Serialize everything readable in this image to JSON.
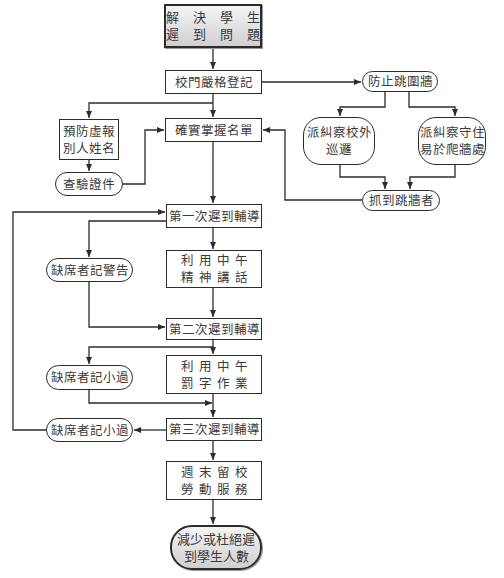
{
  "diagram": {
    "type": "flowchart",
    "nodes": {
      "start": {
        "lines": [
          "解 決 學 生",
          "遲 到 問 題"
        ],
        "shape": "terminal-rect"
      },
      "gate_register": {
        "lines": [
          "校門嚴格登記"
        ],
        "shape": "rect"
      },
      "prevent_fake_name": {
        "lines": [
          "預防虛報",
          "別人姓名"
        ],
        "shape": "rect"
      },
      "check_id": {
        "lines": [
          "查驗證件"
        ],
        "shape": "pill"
      },
      "confirm_list": {
        "lines": [
          "確實掌握名單"
        ],
        "shape": "rect"
      },
      "prevent_wall_jump": {
        "lines": [
          "防止跳圍牆"
        ],
        "shape": "pill"
      },
      "patrol_outside": {
        "lines": [
          "派糾察校外",
          "巡邏"
        ],
        "shape": "rounded"
      },
      "guard_wall": {
        "lines": [
          "派糾察守住",
          "易於爬牆處"
        ],
        "shape": "rounded"
      },
      "catch_jumpers": {
        "lines": [
          "抓到跳牆者"
        ],
        "shape": "pill"
      },
      "first_counsel": {
        "lines": [
          "第一次遲到輔導"
        ],
        "shape": "rect"
      },
      "noon_talk": {
        "lines": [
          "利用中午",
          "精神講話"
        ],
        "shape": "rect"
      },
      "absent_warning": {
        "lines": [
          "缺席者記警告"
        ],
        "shape": "pill"
      },
      "second_counsel": {
        "lines": [
          "第二次遲到輔導"
        ],
        "shape": "rect"
      },
      "noon_writing": {
        "lines": [
          "利用中午",
          "罰字作業"
        ],
        "shape": "rect"
      },
      "absent_demerit_1": {
        "lines": [
          "缺席者記小過"
        ],
        "shape": "pill"
      },
      "third_counsel": {
        "lines": [
          "第三次遲到輔導"
        ],
        "shape": "rect"
      },
      "absent_demerit_2": {
        "lines": [
          "缺席者記小過"
        ],
        "shape": "pill"
      },
      "weekend_service": {
        "lines": [
          "週末留校",
          "勞動服務"
        ],
        "shape": "rect"
      },
      "end": {
        "lines": [
          "減少或杜絕遲",
          "到學生人數"
        ],
        "shape": "terminal-pill"
      }
    },
    "edges": [
      [
        "start",
        "gate_register"
      ],
      [
        "gate_register",
        "confirm_list"
      ],
      [
        "gate_register",
        "prevent_fake_name"
      ],
      [
        "gate_register",
        "prevent_wall_jump"
      ],
      [
        "prevent_fake_name",
        "check_id"
      ],
      [
        "check_id",
        "confirm_list"
      ],
      [
        "prevent_wall_jump",
        "patrol_outside"
      ],
      [
        "prevent_wall_jump",
        "guard_wall"
      ],
      [
        "patrol_outside",
        "catch_jumpers"
      ],
      [
        "guard_wall",
        "catch_jumpers"
      ],
      [
        "catch_jumpers",
        "confirm_list"
      ],
      [
        "confirm_list",
        "first_counsel"
      ],
      [
        "first_counsel",
        "noon_talk"
      ],
      [
        "first_counsel",
        "absent_warning"
      ],
      [
        "noon_talk",
        "second_counsel"
      ],
      [
        "absent_warning",
        "second_counsel"
      ],
      [
        "second_counsel",
        "noon_writing"
      ],
      [
        "second_counsel",
        "absent_demerit_1"
      ],
      [
        "noon_writing",
        "third_counsel"
      ],
      [
        "absent_demerit_1",
        "third_counsel"
      ],
      [
        "third_counsel",
        "absent_demerit_2"
      ],
      [
        "absent_demerit_2",
        "first_counsel"
      ],
      [
        "third_counsel",
        "weekend_service"
      ],
      [
        "weekend_service",
        "end"
      ]
    ],
    "colors": {
      "line": "#2c2c2c",
      "text": "#3a3a3a",
      "terminal_fill_top": "#f4f4f4",
      "terminal_fill_bottom": "#d0d0d0"
    }
  }
}
